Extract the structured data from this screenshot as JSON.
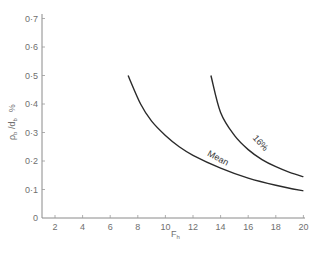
{
  "chart_data": {
    "type": "line",
    "title": "",
    "xlabel": "F_h",
    "ylabel": "ρ_b / d_b %",
    "xlim": [
      1,
      20
    ],
    "ylim": [
      0,
      0.7
    ],
    "grid": false,
    "legend": "inline curve labels",
    "x_ticks": [
      2,
      4,
      6,
      8,
      10,
      12,
      14,
      16,
      18,
      20
    ],
    "y_ticks": [
      0,
      0.1,
      0.2,
      0.3,
      0.4,
      0.5,
      0.6,
      0.7
    ],
    "x_tick_labels": [
      "2",
      "4",
      "6",
      "8",
      "10",
      "12",
      "14",
      "16",
      "18",
      "20"
    ],
    "y_tick_labels": [
      "0",
      "0·1",
      "0·2",
      "0·3",
      "0·4",
      "0·5",
      "0·6",
      "0·7"
    ],
    "series": [
      {
        "name": "Mean",
        "x": [
          7.3,
          8.2,
          9.0,
          10.0,
          11.0,
          12.0,
          14.0,
          16.0,
          18.0,
          20.0
        ],
        "y": [
          0.5,
          0.4,
          0.34,
          0.29,
          0.25,
          0.22,
          0.175,
          0.14,
          0.115,
          0.095
        ]
      },
      {
        "name": "16%",
        "x": [
          13.3,
          14.0,
          15.0,
          16.0,
          17.0,
          18.0,
          19.0,
          20.0
        ],
        "y": [
          0.5,
          0.37,
          0.29,
          0.24,
          0.205,
          0.18,
          0.16,
          0.145
        ]
      }
    ],
    "annotations": [
      {
        "text": "Mean",
        "x": 13.0,
        "y": 0.22
      },
      {
        "text": "16%",
        "x": 16.3,
        "y": 0.28
      }
    ]
  },
  "labels": {
    "x_axis_main": "F",
    "x_axis_sub": "h",
    "y_axis_rho": "ρ",
    "y_axis_rho_sub": "b",
    "y_axis_slash": " /d",
    "y_axis_d_sub": "b",
    "y_axis_pct": "%"
  }
}
